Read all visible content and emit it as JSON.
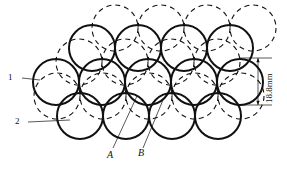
{
  "figure": {
    "type": "engineering-cross-section-diagram",
    "background_color": "#ffffff",
    "line_color": "#111111"
  },
  "labels": {
    "callout_1": "1",
    "callout_2": "2",
    "point_a": "A",
    "point_b": "B"
  },
  "dimension": {
    "value": "18.8mm",
    "orientation": "vertical",
    "top_y": 58,
    "bottom_y": 105
  },
  "geometry": {
    "radius": 23,
    "row_spacing": 27,
    "rows": [
      {
        "name": "top-row",
        "count": 4,
        "cy": 48,
        "cx": [
          92,
          138,
          184,
          230
        ]
      },
      {
        "name": "middle-row",
        "count": 5,
        "cy": 82,
        "cx": [
          56,
          102,
          148,
          194,
          240
        ]
      },
      {
        "name": "bottom-row",
        "count": 4,
        "cy": 116,
        "cx": [
          80,
          126,
          172,
          218
        ]
      }
    ],
    "dashed_rows": [
      {
        "name": "dashed-top-row",
        "count": 4,
        "cy": 28,
        "cx": [
          115,
          161,
          207,
          253
        ]
      },
      {
        "name": "dashed-upper-row",
        "count": 4,
        "cy": 62,
        "cx": [
          79,
          125,
          171,
          217
        ]
      },
      {
        "name": "dashed-lower-row",
        "count": 5,
        "cy": 96,
        "cx": [
          57,
          103,
          149,
          195,
          241
        ]
      }
    ]
  },
  "leaders": {
    "callout_1": {
      "x1": 22,
      "y1": 78,
      "x2": 40,
      "y2": 80
    },
    "callout_2": {
      "x1": 28,
      "y1": 122,
      "x2": 70,
      "y2": 120
    },
    "point_a": {
      "x1": 113,
      "y1": 148,
      "x2": 137,
      "y2": 96
    },
    "point_b": {
      "x1": 143,
      "y1": 148,
      "x2": 163,
      "y2": 100
    }
  }
}
